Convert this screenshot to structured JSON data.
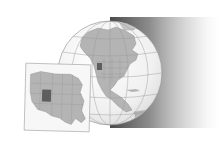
{
  "figure": {
    "type": "locator-map",
    "subject": "Utah",
    "globe": {
      "region_shown": "North America",
      "highlight": "Utah"
    },
    "inset": {
      "region_shown": "Western United States",
      "highlight": "Utah"
    },
    "colors": {
      "background": "#ffffff",
      "ocean": "#f2f2f2",
      "land": "#b4b4b4",
      "highlight": "#5e5e5e",
      "graticule": "#9a9a9a",
      "shadow": "#3a3a3a",
      "inset_frame": "#f7f7f7"
    }
  }
}
